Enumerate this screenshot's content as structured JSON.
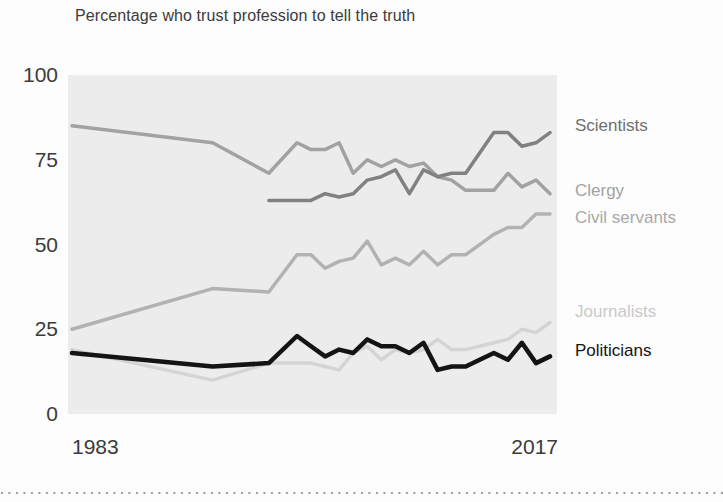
{
  "title": "Percentage who trust profession to tell the truth",
  "chart_data": {
    "type": "line",
    "title": "Percentage who trust profession to tell the truth",
    "xlabel": "",
    "ylabel": "",
    "xlim": [
      1983,
      2017
    ],
    "ylim": [
      0,
      100
    ],
    "grid": false,
    "legend_position": "right-edge-labels",
    "plot_background": "#ececec",
    "x": [
      1983,
      1993,
      1997,
      1999,
      2000,
      2001,
      2002,
      2003,
      2004,
      2005,
      2006,
      2007,
      2008,
      2009,
      2010,
      2011,
      2013,
      2014,
      2015,
      2016,
      2017
    ],
    "yticks": [
      0,
      25,
      50,
      75,
      100
    ],
    "ytick_labels": [
      "0",
      "25",
      "50",
      "75",
      "100"
    ],
    "xtick_labels": [
      "1983",
      "2017"
    ],
    "series": [
      {
        "name": "Journalists",
        "color": "#d4d4d4",
        "label_color": "#c9c9c9",
        "line_width": 3.5,
        "label_dy": -10,
        "values": [
          19,
          10,
          15,
          15,
          15,
          14,
          13,
          18,
          20,
          16,
          19,
          18,
          19,
          22,
          19,
          19,
          21,
          22,
          25,
          24,
          27
        ]
      },
      {
        "name": "Civil servants",
        "color": "#b2b2b2",
        "label_color": "#a8a8a8",
        "line_width": 3.5,
        "label_dy": 4,
        "values": [
          25,
          37,
          36,
          47,
          47,
          43,
          45,
          46,
          51,
          44,
          46,
          44,
          48,
          44,
          47,
          47,
          53,
          55,
          55,
          59,
          59
        ]
      },
      {
        "name": "Clergy",
        "color": "#a2a2a2",
        "label_color": "#a2a2a2",
        "line_width": 3.5,
        "label_dy": -3,
        "values": [
          85,
          80,
          71,
          80,
          78,
          78,
          80,
          71,
          75,
          73,
          75,
          73,
          74,
          70,
          69,
          66,
          66,
          71,
          67,
          69,
          65
        ]
      },
      {
        "name": "Scientists",
        "color": "#818181",
        "label_color": "#6f6f6f",
        "line_width": 3.5,
        "label_dy": -7,
        "values": [
          null,
          null,
          63,
          63,
          63,
          65,
          64,
          65,
          69,
          70,
          72,
          65,
          72,
          70,
          71,
          71,
          83,
          83,
          79,
          80,
          83
        ]
      },
      {
        "name": "Politicians",
        "color": "#141414",
        "label_color": "#141414",
        "line_width": 4.5,
        "label_dy": -5,
        "values": [
          18,
          14,
          15,
          23,
          20,
          17,
          19,
          18,
          22,
          20,
          20,
          18,
          21,
          13,
          14,
          14,
          18,
          16,
          21,
          15,
          17
        ]
      }
    ]
  }
}
